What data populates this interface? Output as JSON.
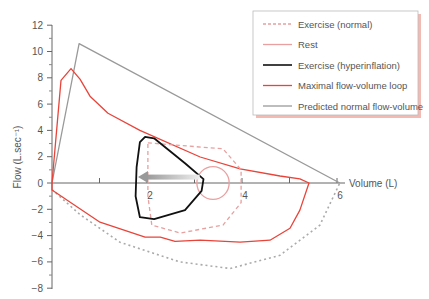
{
  "chart_data": {
    "type": "line",
    "title": "",
    "xlabel": "Volume (L)",
    "ylabel": "Flow (L.sec⁻¹)",
    "xlim": [
      0,
      6
    ],
    "ylim": [
      -8,
      12
    ],
    "xticks": [
      1,
      2,
      3,
      4,
      5,
      6
    ],
    "xtick_labels": {
      "2": "2",
      "4": "4",
      "6": "6"
    },
    "yticks": [
      12,
      10,
      8,
      6,
      4,
      2,
      0,
      -2,
      -4,
      -6,
      -8
    ],
    "ytick_labels": [
      "12",
      "10",
      "8",
      "6",
      "4",
      "2",
      "0",
      "−2",
      "−4",
      "−6",
      "−8"
    ],
    "grid": false,
    "legend_position": "top-right",
    "legend": [
      {
        "label": "Exercise (normal)",
        "color": "#e8a0a0",
        "style": "dashed"
      },
      {
        "label": "Rest",
        "color": "#eaa0a0",
        "style": "solid"
      },
      {
        "label": "Exercise (hyperinflation)",
        "color": "#111111",
        "style": "solid"
      },
      {
        "label": "Maximal flow-volume loop",
        "color": "#e8443a",
        "style": "solid"
      },
      {
        "label": "Predicted normal flow-volume",
        "color": "#999999",
        "style": "solid"
      }
    ],
    "series": [
      {
        "name": "Predicted normal flow-volume",
        "color": "#999999",
        "style": "solid",
        "closed": false,
        "points": [
          [
            0,
            0
          ],
          [
            0.57,
            10.6
          ],
          [
            6.06,
            0
          ]
        ]
      },
      {
        "name": "Predicted normal flow-volume (inspiratory)",
        "color": "#aaaaaa",
        "style": "dotted",
        "closed": false,
        "points": [
          [
            0,
            -0.5
          ],
          [
            0.59,
            -2.4
          ],
          [
            1.43,
            -4.5
          ],
          [
            2.69,
            -6.0
          ],
          [
            3.75,
            -6.5
          ],
          [
            4.8,
            -5.5
          ],
          [
            5.64,
            -3.2
          ],
          [
            6.06,
            0
          ]
        ]
      },
      {
        "name": "Maximal flow-volume loop",
        "color": "#e8443a",
        "style": "solid",
        "closed": true,
        "points": [
          [
            0,
            0
          ],
          [
            0.19,
            7.8
          ],
          [
            0.4,
            8.7
          ],
          [
            0.59,
            7.9
          ],
          [
            0.8,
            6.6
          ],
          [
            1.18,
            5.3
          ],
          [
            1.85,
            4.0
          ],
          [
            3.12,
            1.98
          ],
          [
            3.96,
            1.07
          ],
          [
            4.8,
            0.53
          ],
          [
            5.22,
            0.31
          ],
          [
            5.41,
            0
          ],
          [
            5.22,
            -2.06
          ],
          [
            5.01,
            -3.44
          ],
          [
            4.59,
            -4.35
          ],
          [
            3.96,
            -4.5
          ],
          [
            3.12,
            -4.35
          ],
          [
            2.59,
            -4.43
          ],
          [
            2.28,
            -4.12
          ],
          [
            1.96,
            -4.12
          ],
          [
            1.01,
            -2.98
          ],
          [
            0,
            -0.53
          ]
        ]
      },
      {
        "name": "Exercise (normal)",
        "color": "#e8a0a0",
        "style": "dashed",
        "closed": true,
        "points": [
          [
            2.02,
            3.05
          ],
          [
            3.6,
            2.6
          ],
          [
            3.98,
            1.0
          ],
          [
            3.98,
            -1.5
          ],
          [
            3.6,
            -3.2
          ],
          [
            2.7,
            -3.8
          ],
          [
            2.1,
            -3.2
          ],
          [
            2.02,
            -1.0
          ],
          [
            2.02,
            3.05
          ]
        ]
      },
      {
        "name": "Rest",
        "color": "#eaa0a0",
        "style": "solid",
        "closed": true,
        "ellipse": {
          "cx": 3.39,
          "cy": 0.0,
          "rx": 0.34,
          "ry": 1.25
        }
      },
      {
        "name": "Exercise (hyperinflation)",
        "color": "#111111",
        "style": "solid",
        "closed": true,
        "points": [
          [
            1.96,
            3.51
          ],
          [
            2.15,
            3.4
          ],
          [
            2.8,
            1.5
          ],
          [
            3.19,
            0.3
          ],
          [
            3.15,
            -0.6
          ],
          [
            2.8,
            -2.06
          ],
          [
            2.15,
            -2.75
          ],
          [
            1.85,
            -2.6
          ],
          [
            1.76,
            -1.0
          ],
          [
            1.78,
            1.2
          ],
          [
            1.85,
            3.1
          ],
          [
            1.96,
            3.51
          ]
        ]
      }
    ],
    "annotations": [
      {
        "type": "arrow",
        "from": [
          3.11,
          0.45
        ],
        "to": [
          1.81,
          0.45
        ],
        "color": "#aaaaaa",
        "meaning": "shift toward higher lung volume"
      }
    ]
  }
}
